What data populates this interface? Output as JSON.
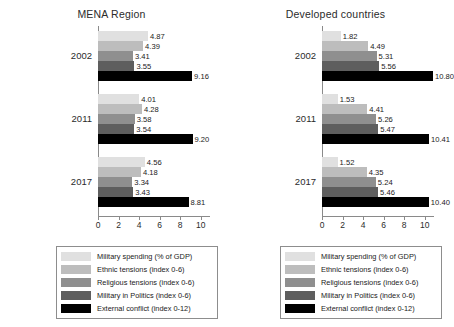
{
  "chart_data": {
    "type": "bar",
    "orientation": "horizontal",
    "title": "",
    "panels": [
      {
        "title": "MENA Region",
        "categories": [
          "2002",
          "2011",
          "2017"
        ],
        "series": [
          {
            "name": "Military spending (% of GDP)",
            "color": "#e0e0e0",
            "values": [
              4.87,
              4.01,
              4.56
            ]
          },
          {
            "name": "Ethnic tensions (index 0-6)",
            "color": "#bdbdbd",
            "values": [
              4.39,
              4.28,
              4.18
            ]
          },
          {
            "name": "Religious tensions (index 0-6)",
            "color": "#8f8f8f",
            "values": [
              3.41,
              3.58,
              3.34
            ]
          },
          {
            "name": "Military in Politics (index 0-6)",
            "color": "#5e5e5e",
            "values": [
              3.55,
              3.54,
              3.43
            ]
          },
          {
            "name": "External conflict (index 0-12)",
            "color": "#000000",
            "values": [
              9.16,
              9.2,
              8.81
            ]
          }
        ]
      },
      {
        "title": "Developed countries",
        "categories": [
          "2002",
          "2011",
          "2017"
        ],
        "series": [
          {
            "name": "Military spending (% of GDP)",
            "color": "#e0e0e0",
            "values": [
              1.82,
              1.53,
              1.52
            ]
          },
          {
            "name": "Ethnic tensions (index 0-6)",
            "color": "#bdbdbd",
            "values": [
              4.49,
              4.41,
              4.35
            ]
          },
          {
            "name": "Religious tensions (index 0-6)",
            "color": "#8f8f8f",
            "values": [
              5.31,
              5.26,
              5.24
            ]
          },
          {
            "name": "Military in Politics (index 0-6)",
            "color": "#5e5e5e",
            "values": [
              5.56,
              5.47,
              5.46
            ]
          },
          {
            "name": "External conflict (index 0-12)",
            "color": "#000000",
            "values": [
              10.8,
              10.41,
              10.4
            ]
          }
        ]
      }
    ],
    "xlabel": "",
    "ylabel": "",
    "xlim": [
      0,
      10.9
    ],
    "xticks": [
      0,
      2,
      4,
      6,
      8,
      10
    ],
    "xtick_labels": [
      "0",
      "2",
      "4",
      "6",
      "8",
      "10"
    ],
    "grid": false,
    "legend_position": "bottom",
    "legend_entries": [
      {
        "label": "Military spending (% of GDP)",
        "color": "#e0e0e0"
      },
      {
        "label": "Ethnic tensions (index 0-6)",
        "color": "#bdbdbd"
      },
      {
        "label": "Religious tensions (index 0-6)",
        "color": "#8f8f8f"
      },
      {
        "label": "Military in Politics (index 0-6)",
        "color": "#5e5e5e"
      },
      {
        "label": "External conflict (index 0-12)",
        "color": "#000000"
      }
    ]
  }
}
